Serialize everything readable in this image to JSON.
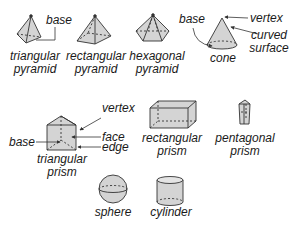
{
  "diagram": {
    "colors": {
      "fill": "#d4d4d4",
      "stroke": "#333333",
      "text": "#1a1a1a"
    },
    "shapes": [
      {
        "id": "triangular-pyramid",
        "caption_line1": "triangular",
        "caption_line2": "pyramid"
      },
      {
        "id": "rectangular-pyramid",
        "caption_line1": "rectangular",
        "caption_line2": "pyramid"
      },
      {
        "id": "hexagonal-pyramid",
        "caption_line1": "hexagonal",
        "caption_line2": "pyramid"
      },
      {
        "id": "cone",
        "caption_line1": "cone"
      },
      {
        "id": "triangular-prism",
        "caption_line1": "triangular",
        "caption_line2": "prism"
      },
      {
        "id": "rectangular-prism",
        "caption_line1": "rectangular",
        "caption_line2": "prism"
      },
      {
        "id": "pentagonal-prism",
        "caption_line1": "pentagonal",
        "caption_line2": "prism"
      },
      {
        "id": "sphere",
        "caption_line1": "sphere"
      },
      {
        "id": "cylinder",
        "caption_line1": "cylinder"
      }
    ],
    "annotations": {
      "pyramid_base": "base",
      "cone_base": "base",
      "cone_vertex": "vertex",
      "cone_curved_line1": "curved",
      "cone_curved_line2": "surface",
      "prism_vertex": "vertex",
      "prism_face": "face",
      "prism_edge": "edge",
      "prism_base": "base"
    }
  }
}
